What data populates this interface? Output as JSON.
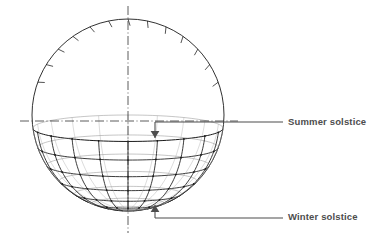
{
  "figure": {
    "background_color": "#ffffff",
    "line_color": "#1a1a1a",
    "faint_line_color": "#808080",
    "label_color": "#4d4d4d",
    "leader_color": "#4d4d4d"
  },
  "annotations": [
    {
      "id": "summer",
      "label": "Summer solstice",
      "arrow_direction": "down",
      "arrow_x": 155,
      "arrow_y": 138,
      "leader_y": 122,
      "leader_x_start": 155,
      "leader_x_end": 283
    },
    {
      "id": "winter",
      "label": "Winter solstice",
      "arrow_direction": "up",
      "arrow_x": 155,
      "arrow_y": 205,
      "leader_y": 218,
      "leader_x_start": 155,
      "leader_x_end": 283
    }
  ],
  "sphere": {
    "center_x": 128,
    "center_y": 115,
    "radius": 96,
    "tilt_degrees": 8,
    "equator_latitude_deg": 0,
    "parallel_latitudes_deg": [
      -8,
      -20,
      -32,
      -44,
      -56,
      -68,
      -80
    ],
    "meridian_count": 11,
    "tick_count": 13,
    "tick_length": 7,
    "tick_arc_start_deg": 20,
    "tick_arc_end_deg": 160
  },
  "axes": {
    "vertical_axis": {
      "style": "dash-dot",
      "x": 128,
      "y_top": 6,
      "y_bottom": 233
    },
    "horizontal_axis": {
      "style": "dash-dot",
      "y": 121,
      "x_left": 20,
      "x_right": 238
    }
  },
  "chart_data": {
    "type": "line",
    "xlabel": "",
    "ylabel": "",
    "series": [
      {
        "name": "Summer solstice path",
        "latitude_deg": -8
      },
      {
        "name": "Winter solstice path",
        "latitude_deg": -80
      }
    ],
    "annotations": [
      "Summer solstice",
      "Winter solstice"
    ]
  }
}
